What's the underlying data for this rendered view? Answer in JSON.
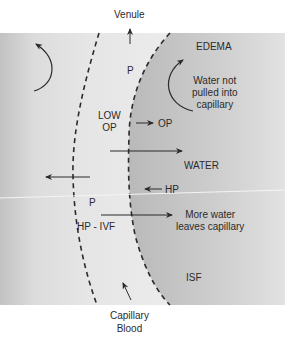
{
  "diagram": {
    "labels": {
      "venule": "Venule",
      "edema": "EDEMA",
      "p_top": "P",
      "water_not_pulled": "Water not\npulled into\ncapillary",
      "low_op": "LOW\nOP",
      "op": "OP",
      "water": "WATER",
      "hp": "HP",
      "p_bottom": "P",
      "hp_ivf": "HP - IVF",
      "more_water": "More water\nleaves capillary",
      "isf": "ISF",
      "capillary_blood": "Capillary\nBlood"
    },
    "colors": {
      "background": "#ffffff",
      "capillary_fill": "#e6e6e6",
      "interstitial_fill": "#c4c4c4",
      "left_gradient_dark": "#bdbdbd",
      "stroke": "#2b2b2b"
    }
  }
}
